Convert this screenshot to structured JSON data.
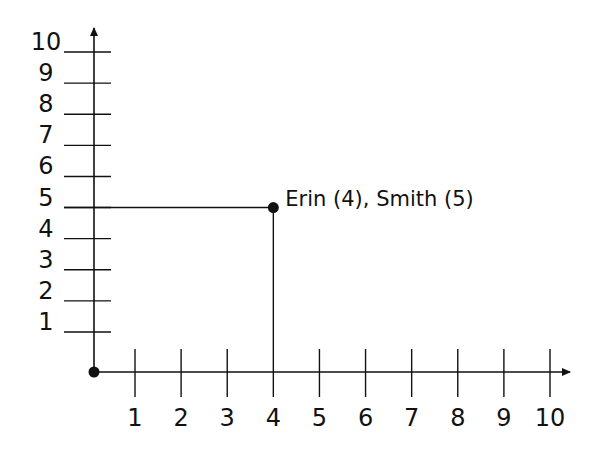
{
  "chart_data": {
    "type": "scatter",
    "title": "",
    "xlabel": "",
    "ylabel": "",
    "xlim": [
      0,
      10
    ],
    "ylim": [
      0,
      10
    ],
    "grid": false,
    "x_ticks": [
      "1",
      "2",
      "3",
      "4",
      "5",
      "6",
      "7",
      "8",
      "9",
      "10"
    ],
    "y_ticks": [
      "1",
      "2",
      "3",
      "4",
      "5",
      "6",
      "7",
      "8",
      "9",
      "10"
    ],
    "points": [
      {
        "x": 0,
        "y": 0,
        "label": ""
      },
      {
        "x": 4,
        "y": 5,
        "label": "Erin (4), Smith (5)"
      }
    ],
    "annotations": [
      {
        "text": "Erin (4), Smith (5)",
        "x": 4,
        "y": 5
      },
      {
        "type": "guide-lines",
        "from_point": [
          4,
          5
        ],
        "to_axes": true
      }
    ]
  },
  "colors": {
    "ink": "#111111",
    "background": "#ffffff"
  }
}
